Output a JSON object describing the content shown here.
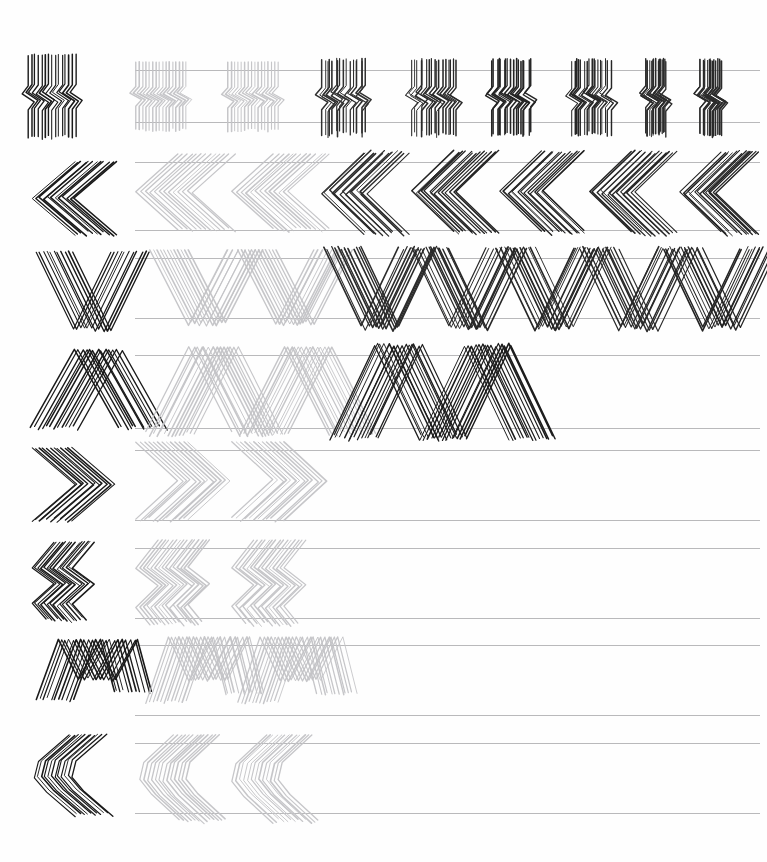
{
  "document": {
    "kind": "pattern-practice-worksheet",
    "title": "Zigzag Stroke Practice Sheet",
    "page_width": 767,
    "page_height": 862,
    "background_color": "#fefefe",
    "guide_line_color": "#b9b9bb",
    "exemplar_ink_color": "#1a1a1a",
    "template_ink_color": "#c3c3c6",
    "attempt_ink_color": "#262626",
    "guide_left": 135,
    "guide_right": 760,
    "row_count": 8,
    "columns_per_row": 8,
    "column_note": "column 1-2 are faint printed templates, columns 3+ are darker hand-drawn attempts"
  },
  "rows": [
    {
      "index": 1,
      "name": "vertical-wiggle",
      "label": "Vertical wiggle strokes",
      "top": 70,
      "bottom": 122,
      "exemplar": {
        "x": 28,
        "y": 55,
        "width": 88,
        "height": 82
      },
      "path": "M 0 0 L 0 30 L -6 38 L 6 46 L 0 54 L 0 82",
      "repeat": 13,
      "step": 6.6,
      "templates": [
        {
          "x": 136,
          "width": 90
        },
        {
          "x": 228,
          "width": 90
        }
      ],
      "attempts": [
        {
          "x": 322,
          "width": 84,
          "ink": "#303030"
        },
        {
          "x": 412,
          "width": 84,
          "ink": "#2a2a2a"
        },
        {
          "x": 492,
          "width": 78,
          "ink": "#242424"
        },
        {
          "x": 572,
          "width": 78,
          "ink": "#262626"
        },
        {
          "x": 646,
          "width": 60,
          "ink": "#2c2c2c"
        },
        {
          "x": 700,
          "width": 62,
          "ink": "#2a2a2a"
        }
      ]
    },
    {
      "index": 2,
      "name": "left-chevron",
      "label": "Left-pointing chevrons",
      "top": 162,
      "bottom": 230,
      "exemplar": {
        "x": 32,
        "y": 162,
        "width": 82,
        "height": 72
      },
      "path": "M 42 0 L 0 36 L 42 72",
      "repeat": 10,
      "step": 8.4,
      "templates": [
        {
          "x": 136,
          "width": 96
        },
        {
          "x": 232,
          "width": 96
        }
      ],
      "attempts": [
        {
          "x": 322,
          "width": 84,
          "ink": "#2b2b2b"
        },
        {
          "x": 412,
          "width": 84,
          "ink": "#242424"
        },
        {
          "x": 500,
          "width": 84,
          "ink": "#212121"
        },
        {
          "x": 590,
          "width": 84,
          "ink": "#252525"
        },
        {
          "x": 680,
          "width": 76,
          "ink": "#232323"
        }
      ]
    },
    {
      "index": 3,
      "name": "v-chevron-down",
      "label": "Downward V chevrons",
      "top": 258,
      "bottom": 318,
      "exemplar": {
        "x": 36,
        "y": 252,
        "width": 76,
        "height": 78
      },
      "path": "M 0 0 L 38 78 L 76 0",
      "repeat": 9,
      "step": 4.2,
      "templates": [
        {
          "x": 150,
          "width": 78
        },
        {
          "x": 238,
          "width": 78
        }
      ],
      "attempts": [
        {
          "x": 324,
          "width": 78,
          "ink": "#2b2b2b"
        },
        {
          "x": 412,
          "width": 78,
          "ink": "#282828"
        },
        {
          "x": 496,
          "width": 78,
          "ink": "#262626"
        },
        {
          "x": 580,
          "width": 78,
          "ink": "#2a2a2a"
        },
        {
          "x": 664,
          "width": 78,
          "ink": "#242424"
        }
      ]
    },
    {
      "index": 4,
      "name": "a-chevron-up",
      "label": "Upward A chevrons",
      "top": 355,
      "bottom": 428,
      "exemplar": {
        "x": 30,
        "y": 350,
        "width": 88,
        "height": 78
      },
      "path": "M 0 78 L 44 0 L 88 78",
      "repeat": 11,
      "step": 4.0,
      "templates": [
        {
          "x": 146,
          "width": 88
        },
        {
          "x": 240,
          "width": 88
        }
      ],
      "attempts": [
        {
          "x": 330,
          "width": 88,
          "ink": "#1f1f1f"
        },
        {
          "x": 420,
          "width": 88,
          "ink": "#1c1c1c"
        }
      ]
    },
    {
      "index": 5,
      "name": "right-chevron",
      "label": "Right-pointing chevrons",
      "top": 450,
      "bottom": 520,
      "exemplar": {
        "x": 32,
        "y": 448,
        "width": 80,
        "height": 72
      },
      "path": "M 0 0 L 42 36 L 0 72",
      "repeat": 10,
      "step": 8.0,
      "templates": [
        {
          "x": 136,
          "width": 92
        },
        {
          "x": 232,
          "width": 92
        }
      ],
      "attempts": []
    },
    {
      "index": 6,
      "name": "double-zigzag",
      "label": "Double zigzag strokes",
      "top": 548,
      "bottom": 618,
      "exemplar": {
        "x": 32,
        "y": 542,
        "width": 80,
        "height": 78
      },
      "path": "M 22 0 L 0 26 L 22 42 L 0 62 L 14 78",
      "repeat": 12,
      "step": 6.8,
      "templates": [
        {
          "x": 136,
          "width": 92
        },
        {
          "x": 232,
          "width": 92
        }
      ],
      "attempts": []
    },
    {
      "index": 7,
      "name": "m-wave",
      "label": "M-shaped wave strokes",
      "top": 645,
      "bottom": 715,
      "exemplar": {
        "x": 36,
        "y": 640,
        "width": 78,
        "height": 76
      },
      "path": "M 0 60 L 22 0 L 42 40 L 64 0 L 78 52",
      "repeat": 9,
      "step": 6.0,
      "templates": [
        {
          "x": 146,
          "width": 80
        },
        {
          "x": 238,
          "width": 80
        }
      ],
      "attempts": []
    },
    {
      "index": 8,
      "name": "rounded-left-chevron",
      "label": "Rounded left chevrons",
      "top": 743,
      "bottom": 813,
      "exemplar": {
        "x": 34,
        "y": 735,
        "width": 78,
        "height": 80
      },
      "path": "M 34 0 L 4 26 L 0 42 L 12 56 L 40 80",
      "repeat": 10,
      "step": 6.6,
      "templates": [
        {
          "x": 140,
          "width": 86
        },
        {
          "x": 232,
          "width": 86
        }
      ],
      "attempts": []
    }
  ]
}
